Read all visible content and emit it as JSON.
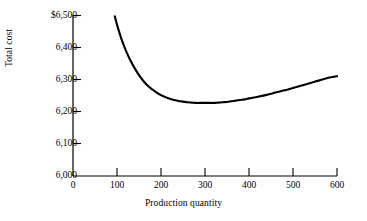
{
  "chart_data": {
    "type": "line",
    "title": "",
    "subtitle": "",
    "xlabel": "Production quantity",
    "ylabel": "Total cost",
    "xlim": [
      0,
      600
    ],
    "ylim": [
      6000,
      6500
    ],
    "grid": false,
    "legend": null,
    "x_ticks": [
      0,
      100,
      200,
      300,
      400,
      500,
      600
    ],
    "x_tick_labels": [
      "0",
      "100",
      "200",
      "300",
      "400",
      "500",
      "600"
    ],
    "y_ticks": [
      6000,
      6100,
      6200,
      6300,
      6400,
      6500
    ],
    "y_tick_labels": [
      "6,000",
      "6,100",
      "6,200",
      "6,300",
      "6,400",
      "6,500"
    ],
    "y_top_tick_label": "$6,500",
    "series": [
      {
        "name": "Total cost",
        "color": "#000000",
        "x": [
          95,
          100,
          110,
          120,
          130,
          140,
          150,
          160,
          170,
          180,
          190,
          200,
          210,
          220,
          230,
          240,
          250,
          260,
          270,
          280,
          290,
          300,
          310,
          320,
          330,
          340,
          350,
          360,
          370,
          380,
          390,
          400,
          420,
          440,
          460,
          480,
          500,
          520,
          540,
          560,
          580,
          600
        ],
        "y": [
          6496,
          6470,
          6426,
          6390,
          6360,
          6335,
          6313,
          6295,
          6280,
          6269,
          6259,
          6251,
          6245,
          6240,
          6236,
          6233,
          6231,
          6229,
          6228,
          6227,
          6227,
          6227,
          6227,
          6227,
          6228,
          6229,
          6230,
          6232,
          6234,
          6236,
          6238,
          6241,
          6246,
          6252,
          6259,
          6266,
          6273,
          6281,
          6289,
          6297,
          6305,
          6310
        ]
      }
    ],
    "annotations": [],
    "minimum_point": {
      "x": 310,
      "y": 6227
    }
  },
  "axes": {
    "ylabel": "Total cost",
    "xlabel": "Production quantity"
  }
}
